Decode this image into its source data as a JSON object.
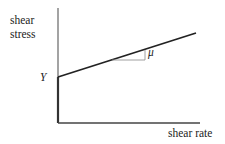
{
  "diagram": {
    "title": "",
    "y_axis_label_line1": "shear",
    "y_axis_label_line2": "stress",
    "x_axis_label": "shear rate",
    "intercept_label": "Y",
    "slope_label": "μ",
    "colors": {
      "axis": "#555555",
      "line": "#222222",
      "slope_triangle": "#888888",
      "text": "#222222"
    },
    "geometry": {
      "origin": [
        58,
        123
      ],
      "y_axis_top": [
        58,
        8
      ],
      "x_axis_end": [
        200,
        123
      ],
      "line_start": [
        58,
        77
      ],
      "line_end": [
        196,
        33
      ],
      "slope_triangle": {
        "left": [
          112,
          60
        ],
        "corner": [
          145,
          60
        ],
        "top": [
          145,
          50
        ]
      }
    }
  }
}
